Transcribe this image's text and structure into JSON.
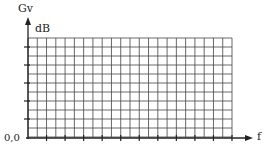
{
  "diagram": {
    "y_axis_label": "Gv",
    "y_axis_unit": "dB",
    "x_axis_label": "f",
    "origin_label": "0,0",
    "grid": {
      "columns": 22,
      "rows": 11,
      "x0": 28,
      "x1": 232,
      "y0": 38,
      "y1": 137
    },
    "x_major_tick_every": 2,
    "y_major_tick_every": 2,
    "line_color": "#333333"
  }
}
